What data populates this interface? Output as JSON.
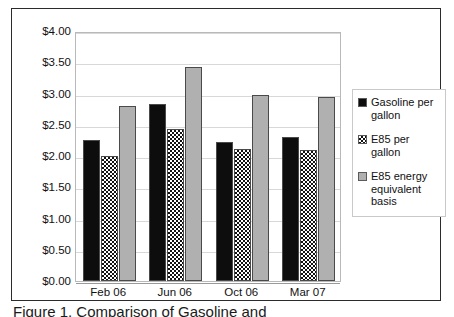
{
  "chart_data": {
    "type": "bar",
    "title": "",
    "xlabel": "",
    "ylabel": "",
    "categories": [
      "Feb 06",
      "Jun 06",
      "Oct 06",
      "Mar 07"
    ],
    "series": [
      {
        "name": "Gasoline per gallon",
        "values": [
          2.25,
          2.83,
          2.22,
          2.3
        ],
        "color": "#0d0d0d",
        "pattern": "solid-black"
      },
      {
        "name": "E85 per gallon",
        "values": [
          2.0,
          2.43,
          2.12,
          2.1
        ],
        "color": "#111111",
        "pattern": "checkerboard"
      },
      {
        "name": "E85 energy equivalent basis",
        "values": [
          2.8,
          3.43,
          2.97,
          2.95
        ],
        "color": "#b0b0b0",
        "pattern": "solid-gray"
      }
    ],
    "ylim": [
      0.0,
      4.0
    ],
    "ytick_step": 0.5,
    "ytick_labels": [
      "$4.00",
      "$3.50",
      "$3.00",
      "$2.50",
      "$2.00",
      "$1.50",
      "$1.00",
      "$0.50",
      "$0.00"
    ],
    "ytick_values": [
      4.0,
      3.5,
      3.0,
      2.5,
      2.0,
      1.5,
      1.0,
      0.5,
      0.0
    ],
    "grid": true,
    "grid_axis": "y",
    "legend_position": "right"
  },
  "legend": {
    "items": [
      {
        "label": "Gasoline per gallon",
        "swatch": "solid-black-swatch"
      },
      {
        "label": "E85 per gallon",
        "swatch": "checkerboard-swatch"
      },
      {
        "label": "E85 energy equivalent basis",
        "swatch": "solid-gray-swatch"
      }
    ]
  },
  "caption": {
    "text": "Figure 1. Comparison of Gasoline and"
  }
}
